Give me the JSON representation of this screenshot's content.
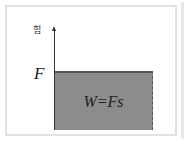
{
  "diagram": {
    "y_axis_label": "힘",
    "force_label": "F",
    "area_label": "W=Fs",
    "colors": {
      "area_fill": "#8c8c8c",
      "area_top_edge": "#555555",
      "axis": "#333333",
      "frame_border": "#e2e2e2"
    }
  }
}
